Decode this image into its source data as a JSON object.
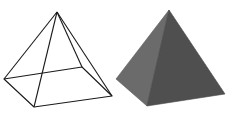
{
  "diagram": {
    "background": "#ffffff",
    "wireframe_pyramid": {
      "stroke": "#1a1a1a",
      "apex": [
        57,
        12
      ],
      "base": {
        "left": [
          4,
          79
        ],
        "front": [
          34,
          107
        ],
        "right": [
          112,
          96
        ],
        "back": [
          82,
          67
        ]
      }
    },
    "solid_pyramid": {
      "left_face_color": "#6b6b6b",
      "right_face_color": "#4f4f4f",
      "apex": [
        169,
        10
      ],
      "base": {
        "left": [
          116,
          79
        ],
        "front": [
          147,
          106
        ],
        "right": [
          225,
          94
        ]
      }
    }
  }
}
